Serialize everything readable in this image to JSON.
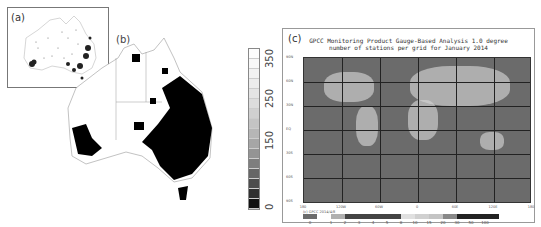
{
  "figure": {
    "panels": [
      {
        "id": "a",
        "label": "(a)",
        "description": "Inset map of Australia showing rain gauge station locations as dots",
        "region": "Australia"
      },
      {
        "id": "b",
        "label": "(b)",
        "description": "Gridded map of Australia shaded by station count / density",
        "region": "Australia",
        "colorbar": {
          "orientation": "vertical",
          "ticks": [
            "0",
            "150",
            "250",
            "350"
          ],
          "range": [
            0,
            380
          ],
          "colormap": "grayscale (black = 0, white = high)"
        }
      },
      {
        "id": "c",
        "label": "(c)",
        "title_line1": "GPCC Monitoring Product Gauge-Based Analysis 1.0 degree",
        "title_line2": "number of stations per grid for January  2014",
        "region": "Global",
        "y_ticks": [
          "90N",
          "60N",
          "30N",
          "EQ",
          "30S",
          "60S",
          "90S"
        ],
        "x_ticks": [
          "180",
          "120W",
          "60W",
          "0",
          "60E",
          "120E",
          "180"
        ],
        "copyright": "(c) GPCC 2014/4/8",
        "colorbar": {
          "orientation": "horizontal",
          "ticks": [
            "0",
            "1",
            "2",
            "3",
            "4",
            "5",
            "8",
            "10",
            "15",
            "20",
            "30",
            "50",
            "100"
          ]
        }
      }
    ]
  },
  "colors": {
    "ocean": "#6b6b6b",
    "grid": "#222222",
    "border": "#999999"
  }
}
